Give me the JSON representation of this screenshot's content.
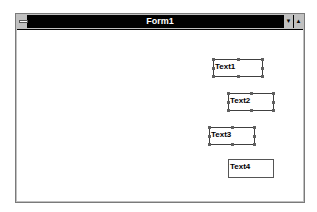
{
  "window": {
    "title": "Form1",
    "control_menu_icon": "system-menu-icon",
    "buttons": [
      {
        "name": "minimize",
        "glyph": "▼"
      },
      {
        "name": "maximize",
        "glyph": "▲"
      }
    ]
  },
  "form": {
    "grid": "dotted design grid",
    "textboxes": [
      {
        "label": "Text1",
        "selected": true
      },
      {
        "label": "Text2",
        "selected": true
      },
      {
        "label": "Text3",
        "selected": true
      },
      {
        "label": "Text4",
        "selected": false
      }
    ]
  },
  "colors": {
    "titlebar": "#000000",
    "title_text": "#ffffff",
    "frame": "#c0c0c0",
    "client": "#ffffff"
  }
}
